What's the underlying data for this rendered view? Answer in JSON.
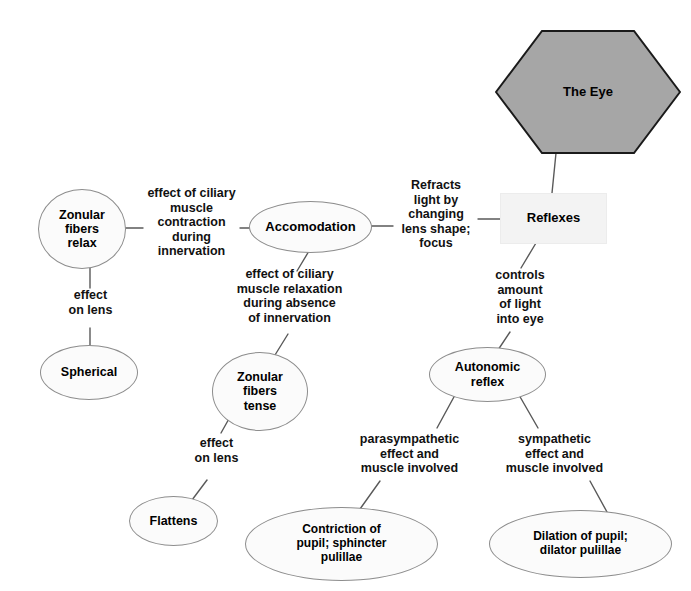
{
  "diagram": {
    "title": "The Eye",
    "type": "concept-map",
    "colors": {
      "hexagon_fill": "#a6a6a6",
      "hexagon_stroke": "#1a1a1a",
      "oval_fill": "#fbfbfb",
      "oval_stroke": "#8d8d8d",
      "rect_fill": "#f3f3f3",
      "line": "#595959",
      "text": "#000000"
    },
    "nodes": [
      {
        "id": "the-eye",
        "shape": "hexagon",
        "label": "The Eye",
        "font_size": 13
      },
      {
        "id": "reflexes",
        "shape": "rectangle",
        "label": "Reflexes",
        "font_size": 13
      },
      {
        "id": "accomodation",
        "shape": "oval",
        "label": "Accomodation",
        "font_size": 13
      },
      {
        "id": "zonular-fibers-relax",
        "shape": "oval",
        "label": "Zonular\nfibers\nrelax",
        "font_size": 12.5
      },
      {
        "id": "spherical",
        "shape": "oval",
        "label": "Spherical",
        "font_size": 12.5
      },
      {
        "id": "zonular-fibers-tense",
        "shape": "oval",
        "label": "Zonular\nfibers\ntense",
        "font_size": 12.5
      },
      {
        "id": "flattens",
        "shape": "oval",
        "label": "Flattens",
        "font_size": 12.5
      },
      {
        "id": "autonomic-reflex",
        "shape": "oval",
        "label": "Autonomic\nreflex",
        "font_size": 12.5
      },
      {
        "id": "contriction-of-pupil",
        "shape": "oval",
        "label": "Contriction of\npupil; sphincter\npulillae",
        "font_size": 12
      },
      {
        "id": "dilation-of-pupil",
        "shape": "oval",
        "label": "Dilation of pupil;\ndilator pulillae",
        "font_size": 12
      }
    ],
    "edge_labels": [
      {
        "id": "refracts-light",
        "text": "Refracts\nlight by\nchanging\nlens shape;\nfocus",
        "from": "accomodation",
        "to": "reflexes"
      },
      {
        "id": "effect-ciliary-contraction",
        "text": "effect of ciliary\nmuscle\ncontraction\nduring\ninnervation",
        "from": "zonular-fibers-relax",
        "to": "accomodation"
      },
      {
        "id": "effect-ciliary-relaxation",
        "text": "effect of ciliary\nmuscle relaxation\nduring absence\nof innervation",
        "from": "accomodation",
        "to": "zonular-fibers-tense"
      },
      {
        "id": "effect-on-lens-left",
        "text": "effect\non lens",
        "from": "zonular-fibers-relax",
        "to": "spherical"
      },
      {
        "id": "effect-on-lens-mid",
        "text": "effect\non lens",
        "from": "zonular-fibers-tense",
        "to": "flattens"
      },
      {
        "id": "controls-amount-of-light",
        "text": "controls\namount\nof light\ninto eye",
        "from": "reflexes",
        "to": "autonomic-reflex"
      },
      {
        "id": "parasympathetic",
        "text": "parasympathetic\neffect and\nmuscle involved",
        "from": "autonomic-reflex",
        "to": "contriction-of-pupil"
      },
      {
        "id": "sympathetic",
        "text": "sympathetic\neffect and\nmuscle involved",
        "from": "autonomic-reflex",
        "to": "dilation-of-pupil"
      }
    ]
  }
}
